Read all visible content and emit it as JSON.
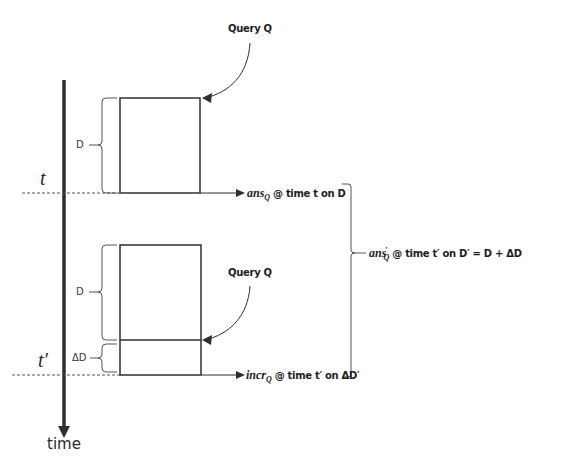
{
  "diagram": {
    "axis": {
      "label": "time",
      "t_label": "t",
      "t_prime_label": "t′"
    },
    "top_block": {
      "bracket_label": "D",
      "query_label": "Query Q",
      "result": {
        "math": "ans",
        "subscript": "Q",
        "text": " @ time t on D"
      }
    },
    "bottom_block": {
      "d_bracket_label": "D",
      "delta_bracket_label": "ΔD",
      "query_label": "Query Q",
      "result": {
        "math": "incr",
        "subscript": "Q",
        "text": " @ time t′ on ΔD′"
      }
    },
    "combined_result": {
      "math": "ans",
      "prime": "′",
      "subscript": "Q",
      "text": " @ time t′ on D′ = D + ΔD"
    },
    "colors": {
      "line": "#2f2f2f",
      "dashed": "#555555",
      "background": "#ffffff"
    }
  }
}
